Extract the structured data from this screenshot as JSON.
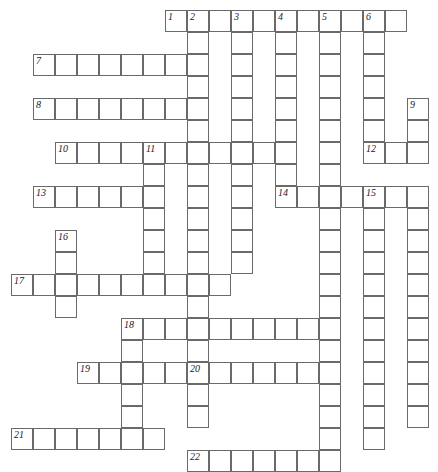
{
  "puzzle": {
    "title": "Crossword Grid",
    "grid": {
      "origin_x": 11,
      "origin_y": 10,
      "cell_size": 22,
      "columns": 19,
      "rows": 21,
      "cell_fill": "#ffffff",
      "cell_border": "#6a6a6a",
      "number_color": "#1a1a1a",
      "background": "#ffffff"
    },
    "entries": [
      {
        "number": "1",
        "direction": "across",
        "col": 7,
        "row": 0,
        "length": 11
      },
      {
        "number": "2",
        "direction": "down",
        "col": 8,
        "row": 0,
        "length": 16
      },
      {
        "number": "3",
        "direction": "down",
        "col": 10,
        "row": 0,
        "length": 12
      },
      {
        "number": "4",
        "direction": "down",
        "col": 12,
        "row": 0,
        "length": 8
      },
      {
        "number": "5",
        "direction": "down",
        "col": 14,
        "row": 0,
        "length": 21
      },
      {
        "number": "6",
        "direction": "down",
        "col": 16,
        "row": 0,
        "length": 7
      },
      {
        "number": "7",
        "direction": "across",
        "col": 1,
        "row": 2,
        "length": 7
      },
      {
        "number": "8",
        "direction": "across",
        "col": 1,
        "row": 4,
        "length": 7
      },
      {
        "number": "9",
        "direction": "down",
        "col": 18,
        "row": 4,
        "length": 15
      },
      {
        "number": "10",
        "direction": "across",
        "col": 2,
        "row": 6,
        "length": 11
      },
      {
        "number": "11",
        "direction": "down",
        "col": 6,
        "row": 6,
        "length": 5
      },
      {
        "number": "12",
        "direction": "across",
        "col": 16,
        "row": 6,
        "length": 3
      },
      {
        "number": "13",
        "direction": "across",
        "col": 1,
        "row": 8,
        "length": 6
      },
      {
        "number": "14",
        "direction": "across",
        "col": 12,
        "row": 8,
        "length": 7
      },
      {
        "number": "15",
        "direction": "down",
        "col": 16,
        "row": 8,
        "length": 12
      },
      {
        "number": "16",
        "direction": "down",
        "col": 2,
        "row": 10,
        "length": 4
      },
      {
        "number": "17",
        "direction": "across",
        "col": 0,
        "row": 12,
        "length": 10
      },
      {
        "number": "18",
        "direction": "across",
        "col": 5,
        "row": 14,
        "length": 10
      },
      {
        "number": "19",
        "direction": "across",
        "col": 3,
        "row": 16,
        "length": 12
      },
      {
        "number": "20",
        "direction": "down",
        "col": 8,
        "row": 16,
        "length": 3
      },
      {
        "number": "21",
        "direction": "across",
        "col": 0,
        "row": 19,
        "length": 7
      },
      {
        "number": "22",
        "direction": "across",
        "col": 8,
        "row": 20,
        "length": 7
      }
    ],
    "cells": [
      {
        "col": 7,
        "row": 0,
        "num": "1"
      },
      {
        "col": 8,
        "row": 0,
        "num": "2"
      },
      {
        "col": 9,
        "row": 0,
        "num": ""
      },
      {
        "col": 10,
        "row": 0,
        "num": "3"
      },
      {
        "col": 11,
        "row": 0,
        "num": ""
      },
      {
        "col": 12,
        "row": 0,
        "num": "4"
      },
      {
        "col": 13,
        "row": 0,
        "num": ""
      },
      {
        "col": 14,
        "row": 0,
        "num": "5"
      },
      {
        "col": 15,
        "row": 0,
        "num": ""
      },
      {
        "col": 16,
        "row": 0,
        "num": "6"
      },
      {
        "col": 17,
        "row": 0,
        "num": ""
      },
      {
        "col": 8,
        "row": 1,
        "num": ""
      },
      {
        "col": 10,
        "row": 1,
        "num": ""
      },
      {
        "col": 12,
        "row": 1,
        "num": ""
      },
      {
        "col": 14,
        "row": 1,
        "num": ""
      },
      {
        "col": 16,
        "row": 1,
        "num": ""
      },
      {
        "col": 1,
        "row": 2,
        "num": "7"
      },
      {
        "col": 2,
        "row": 2,
        "num": ""
      },
      {
        "col": 3,
        "row": 2,
        "num": ""
      },
      {
        "col": 4,
        "row": 2,
        "num": ""
      },
      {
        "col": 5,
        "row": 2,
        "num": ""
      },
      {
        "col": 6,
        "row": 2,
        "num": ""
      },
      {
        "col": 7,
        "row": 2,
        "num": ""
      },
      {
        "col": 8,
        "row": 2,
        "num": ""
      },
      {
        "col": 10,
        "row": 2,
        "num": ""
      },
      {
        "col": 12,
        "row": 2,
        "num": ""
      },
      {
        "col": 14,
        "row": 2,
        "num": ""
      },
      {
        "col": 16,
        "row": 2,
        "num": ""
      },
      {
        "col": 8,
        "row": 3,
        "num": ""
      },
      {
        "col": 10,
        "row": 3,
        "num": ""
      },
      {
        "col": 12,
        "row": 3,
        "num": ""
      },
      {
        "col": 14,
        "row": 3,
        "num": ""
      },
      {
        "col": 16,
        "row": 3,
        "num": ""
      },
      {
        "col": 1,
        "row": 4,
        "num": "8"
      },
      {
        "col": 2,
        "row": 4,
        "num": ""
      },
      {
        "col": 3,
        "row": 4,
        "num": ""
      },
      {
        "col": 4,
        "row": 4,
        "num": ""
      },
      {
        "col": 5,
        "row": 4,
        "num": ""
      },
      {
        "col": 6,
        "row": 4,
        "num": ""
      },
      {
        "col": 7,
        "row": 4,
        "num": ""
      },
      {
        "col": 8,
        "row": 4,
        "num": ""
      },
      {
        "col": 10,
        "row": 4,
        "num": ""
      },
      {
        "col": 12,
        "row": 4,
        "num": ""
      },
      {
        "col": 14,
        "row": 4,
        "num": ""
      },
      {
        "col": 16,
        "row": 4,
        "num": ""
      },
      {
        "col": 18,
        "row": 4,
        "num": "9"
      },
      {
        "col": 8,
        "row": 5,
        "num": ""
      },
      {
        "col": 10,
        "row": 5,
        "num": ""
      },
      {
        "col": 12,
        "row": 5,
        "num": ""
      },
      {
        "col": 14,
        "row": 5,
        "num": ""
      },
      {
        "col": 16,
        "row": 5,
        "num": ""
      },
      {
        "col": 18,
        "row": 5,
        "num": ""
      },
      {
        "col": 2,
        "row": 6,
        "num": "10"
      },
      {
        "col": 3,
        "row": 6,
        "num": ""
      },
      {
        "col": 4,
        "row": 6,
        "num": ""
      },
      {
        "col": 5,
        "row": 6,
        "num": ""
      },
      {
        "col": 6,
        "row": 6,
        "num": "11"
      },
      {
        "col": 7,
        "row": 6,
        "num": ""
      },
      {
        "col": 8,
        "row": 6,
        "num": ""
      },
      {
        "col": 9,
        "row": 6,
        "num": ""
      },
      {
        "col": 10,
        "row": 6,
        "num": ""
      },
      {
        "col": 11,
        "row": 6,
        "num": ""
      },
      {
        "col": 12,
        "row": 6,
        "num": ""
      },
      {
        "col": 14,
        "row": 6,
        "num": ""
      },
      {
        "col": 16,
        "row": 6,
        "num": "12"
      },
      {
        "col": 17,
        "row": 6,
        "num": ""
      },
      {
        "col": 18,
        "row": 6,
        "num": ""
      },
      {
        "col": 6,
        "row": 7,
        "num": ""
      },
      {
        "col": 8,
        "row": 7,
        "num": ""
      },
      {
        "col": 10,
        "row": 7,
        "num": ""
      },
      {
        "col": 12,
        "row": 7,
        "num": ""
      },
      {
        "col": 14,
        "row": 7,
        "num": ""
      },
      {
        "col": 1,
        "row": 8,
        "num": "13"
      },
      {
        "col": 2,
        "row": 8,
        "num": ""
      },
      {
        "col": 3,
        "row": 8,
        "num": ""
      },
      {
        "col": 4,
        "row": 8,
        "num": ""
      },
      {
        "col": 5,
        "row": 8,
        "num": ""
      },
      {
        "col": 6,
        "row": 8,
        "num": ""
      },
      {
        "col": 8,
        "row": 8,
        "num": ""
      },
      {
        "col": 10,
        "row": 8,
        "num": ""
      },
      {
        "col": 12,
        "row": 8,
        "num": "14"
      },
      {
        "col": 13,
        "row": 8,
        "num": ""
      },
      {
        "col": 14,
        "row": 8,
        "num": ""
      },
      {
        "col": 15,
        "row": 8,
        "num": ""
      },
      {
        "col": 16,
        "row": 8,
        "num": "15"
      },
      {
        "col": 17,
        "row": 8,
        "num": ""
      },
      {
        "col": 18,
        "row": 8,
        "num": ""
      },
      {
        "col": 6,
        "row": 9,
        "num": ""
      },
      {
        "col": 8,
        "row": 9,
        "num": ""
      },
      {
        "col": 10,
        "row": 9,
        "num": ""
      },
      {
        "col": 14,
        "row": 9,
        "num": ""
      },
      {
        "col": 16,
        "row": 9,
        "num": ""
      },
      {
        "col": 18,
        "row": 9,
        "num": ""
      },
      {
        "col": 2,
        "row": 10,
        "num": "16"
      },
      {
        "col": 6,
        "row": 10,
        "num": ""
      },
      {
        "col": 8,
        "row": 10,
        "num": ""
      },
      {
        "col": 10,
        "row": 10,
        "num": ""
      },
      {
        "col": 14,
        "row": 10,
        "num": ""
      },
      {
        "col": 16,
        "row": 10,
        "num": ""
      },
      {
        "col": 18,
        "row": 10,
        "num": ""
      },
      {
        "col": 2,
        "row": 11,
        "num": ""
      },
      {
        "col": 6,
        "row": 11,
        "num": ""
      },
      {
        "col": 8,
        "row": 11,
        "num": ""
      },
      {
        "col": 10,
        "row": 11,
        "num": ""
      },
      {
        "col": 14,
        "row": 11,
        "num": ""
      },
      {
        "col": 16,
        "row": 11,
        "num": ""
      },
      {
        "col": 18,
        "row": 11,
        "num": ""
      },
      {
        "col": 0,
        "row": 12,
        "num": "17"
      },
      {
        "col": 1,
        "row": 12,
        "num": ""
      },
      {
        "col": 2,
        "row": 12,
        "num": ""
      },
      {
        "col": 3,
        "row": 12,
        "num": ""
      },
      {
        "col": 4,
        "row": 12,
        "num": ""
      },
      {
        "col": 5,
        "row": 12,
        "num": ""
      },
      {
        "col": 6,
        "row": 12,
        "num": ""
      },
      {
        "col": 7,
        "row": 12,
        "num": ""
      },
      {
        "col": 8,
        "row": 12,
        "num": ""
      },
      {
        "col": 9,
        "row": 12,
        "num": ""
      },
      {
        "col": 14,
        "row": 12,
        "num": ""
      },
      {
        "col": 16,
        "row": 12,
        "num": ""
      },
      {
        "col": 18,
        "row": 12,
        "num": ""
      },
      {
        "col": 2,
        "row": 13,
        "num": ""
      },
      {
        "col": 8,
        "row": 13,
        "num": ""
      },
      {
        "col": 14,
        "row": 13,
        "num": ""
      },
      {
        "col": 16,
        "row": 13,
        "num": ""
      },
      {
        "col": 18,
        "row": 13,
        "num": ""
      },
      {
        "col": 5,
        "row": 14,
        "num": "18"
      },
      {
        "col": 6,
        "row": 14,
        "num": ""
      },
      {
        "col": 7,
        "row": 14,
        "num": ""
      },
      {
        "col": 8,
        "row": 14,
        "num": ""
      },
      {
        "col": 9,
        "row": 14,
        "num": ""
      },
      {
        "col": 10,
        "row": 14,
        "num": ""
      },
      {
        "col": 11,
        "row": 14,
        "num": ""
      },
      {
        "col": 12,
        "row": 14,
        "num": ""
      },
      {
        "col": 13,
        "row": 14,
        "num": ""
      },
      {
        "col": 14,
        "row": 14,
        "num": ""
      },
      {
        "col": 16,
        "row": 14,
        "num": ""
      },
      {
        "col": 18,
        "row": 14,
        "num": ""
      },
      {
        "col": 5,
        "row": 15,
        "num": ""
      },
      {
        "col": 8,
        "row": 15,
        "num": ""
      },
      {
        "col": 14,
        "row": 15,
        "num": ""
      },
      {
        "col": 16,
        "row": 15,
        "num": ""
      },
      {
        "col": 18,
        "row": 15,
        "num": ""
      },
      {
        "col": 3,
        "row": 16,
        "num": "19"
      },
      {
        "col": 4,
        "row": 16,
        "num": ""
      },
      {
        "col": 5,
        "row": 16,
        "num": ""
      },
      {
        "col": 6,
        "row": 16,
        "num": ""
      },
      {
        "col": 7,
        "row": 16,
        "num": ""
      },
      {
        "col": 8,
        "row": 16,
        "num": "20"
      },
      {
        "col": 9,
        "row": 16,
        "num": ""
      },
      {
        "col": 10,
        "row": 16,
        "num": ""
      },
      {
        "col": 11,
        "row": 16,
        "num": ""
      },
      {
        "col": 12,
        "row": 16,
        "num": ""
      },
      {
        "col": 13,
        "row": 16,
        "num": ""
      },
      {
        "col": 14,
        "row": 16,
        "num": ""
      },
      {
        "col": 16,
        "row": 16,
        "num": ""
      },
      {
        "col": 18,
        "row": 16,
        "num": ""
      },
      {
        "col": 5,
        "row": 17,
        "num": ""
      },
      {
        "col": 8,
        "row": 17,
        "num": ""
      },
      {
        "col": 14,
        "row": 17,
        "num": ""
      },
      {
        "col": 16,
        "row": 17,
        "num": ""
      },
      {
        "col": 18,
        "row": 17,
        "num": ""
      },
      {
        "col": 5,
        "row": 18,
        "num": ""
      },
      {
        "col": 8,
        "row": 18,
        "num": ""
      },
      {
        "col": 14,
        "row": 18,
        "num": ""
      },
      {
        "col": 16,
        "row": 18,
        "num": ""
      },
      {
        "col": 18,
        "row": 18,
        "num": ""
      },
      {
        "col": 0,
        "row": 19,
        "num": "21"
      },
      {
        "col": 1,
        "row": 19,
        "num": ""
      },
      {
        "col": 2,
        "row": 19,
        "num": ""
      },
      {
        "col": 3,
        "row": 19,
        "num": ""
      },
      {
        "col": 4,
        "row": 19,
        "num": ""
      },
      {
        "col": 5,
        "row": 19,
        "num": ""
      },
      {
        "col": 6,
        "row": 19,
        "num": ""
      },
      {
        "col": 14,
        "row": 19,
        "num": ""
      },
      {
        "col": 16,
        "row": 19,
        "num": ""
      },
      {
        "col": 8,
        "row": 20,
        "num": "22"
      },
      {
        "col": 9,
        "row": 20,
        "num": ""
      },
      {
        "col": 10,
        "row": 20,
        "num": ""
      },
      {
        "col": 11,
        "row": 20,
        "num": ""
      },
      {
        "col": 12,
        "row": 20,
        "num": ""
      },
      {
        "col": 13,
        "row": 20,
        "num": ""
      },
      {
        "col": 14,
        "row": 20,
        "num": ""
      }
    ]
  }
}
